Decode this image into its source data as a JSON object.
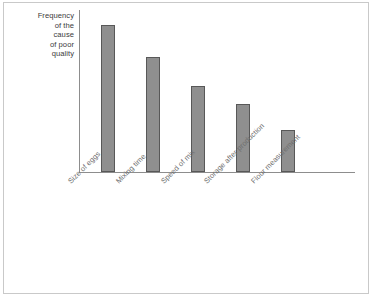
{
  "chart_data": {
    "type": "bar",
    "title": "",
    "subtitle": "",
    "xlabel": "",
    "ylabel": "Frequency of the cause of poor quality",
    "ylabel_lines": [
      "Frequency",
      "of the",
      "cause",
      "of poor",
      "quality"
    ],
    "categories": [
      "Size of eggs",
      "Mixing time",
      "Speed of mix",
      "Storage after production",
      "Flour measurement"
    ],
    "values": [
      147,
      115,
      86,
      68,
      42
    ],
    "value_unit": "pixels of bar height (no numeric axis ticks shown)",
    "ylim": [
      0,
      163
    ],
    "tick_labels": [],
    "grid": false,
    "legend": null,
    "annotations": [],
    "bar_color": "#8f8f8f",
    "bar_border_color": "#585858",
    "axis_color": "#8d8d8d",
    "label_color": "#6e6e6e",
    "caption_color": "#3b3b3b",
    "frame_color": "#c9c9c9",
    "background": "#ffffff",
    "label_rotation_deg": -45,
    "bars": [
      {
        "category": "Size of eggs",
        "value": 147,
        "left": 101,
        "width": 14,
        "height": 147
      },
      {
        "category": "Mixing time",
        "value": 115,
        "left": 146,
        "width": 14,
        "height": 115
      },
      {
        "category": "Speed of mix",
        "value": 86,
        "left": 191,
        "width": 14,
        "height": 86
      },
      {
        "category": "Storage after production",
        "value": 68,
        "left": 236,
        "width": 14,
        "height": 68
      },
      {
        "category": "Flour measurement",
        "value": 42,
        "left": 281,
        "width": 14,
        "height": 42
      }
    ],
    "label_positions": [
      {
        "left": 66,
        "top": 179
      },
      {
        "left": 114,
        "top": 179
      },
      {
        "left": 159,
        "top": 179
      },
      {
        "left": 202,
        "top": 179
      },
      {
        "left": 249,
        "top": 179
      }
    ]
  }
}
